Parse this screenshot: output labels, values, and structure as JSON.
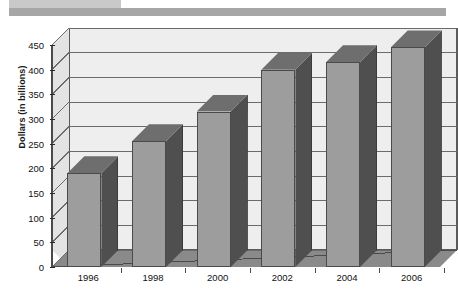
{
  "header": {
    "band_light_color": "#c9c9c9",
    "band_dark_color": "#a6a6a6"
  },
  "figure": {
    "bottom_rule_color": "#8f8f8f"
  },
  "chart_data": {
    "type": "bar",
    "title": "",
    "subtitle": "",
    "xlabel": "",
    "ylabel": "Dollars (in billions)",
    "categories": [
      "1996",
      "1998",
      "2000",
      "2002",
      "2004",
      "2006"
    ],
    "values": [
      190,
      255,
      315,
      400,
      415,
      445
    ],
    "ylim": [
      0,
      450
    ],
    "ytick_labels": [
      "0",
      "50",
      "100",
      "150",
      "200",
      "250",
      "300",
      "350",
      "400",
      "450"
    ],
    "ytick_values": [
      0,
      50,
      100,
      150,
      200,
      250,
      300,
      350,
      400,
      450
    ],
    "grid": true,
    "grid_axis": "y",
    "legend": null,
    "style": "3d",
    "bar_face_color": "#9d9d9d",
    "bar_side_color": "#4f4f4f",
    "bar_top_color": "#6e6e6e",
    "plot_background_color": "#eeeeee",
    "floor_color": "#8a8a8a"
  }
}
